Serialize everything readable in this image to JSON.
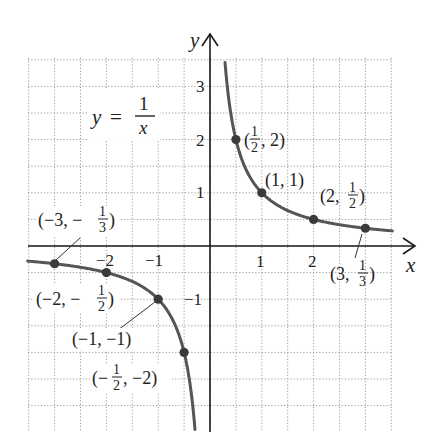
{
  "chart_data": {
    "type": "line",
    "title": "",
    "function": "y = 1/x",
    "equation_label": {
      "lhs": "y",
      "eq": "=",
      "num": "1",
      "den": "x"
    },
    "xlabel": "x",
    "ylabel": "y",
    "xlim": [
      -3.5,
      3.5
    ],
    "ylim": [
      -3.5,
      3.5
    ],
    "grid": true,
    "grid_step": 0.5,
    "x_ticks": [
      {
        "value": -2,
        "label": "−2"
      },
      {
        "value": -1,
        "label": "−1"
      },
      {
        "value": 1,
        "label": "1"
      },
      {
        "value": 2,
        "label": "2"
      }
    ],
    "y_ticks": [
      {
        "value": 3,
        "label": "3"
      },
      {
        "value": 2,
        "label": "2"
      },
      {
        "value": 1,
        "label": "1"
      },
      {
        "value": -1,
        "label": "−1"
      }
    ],
    "series": [
      {
        "name": "y = 1/x (x > 0)",
        "x_range": [
          0.29,
          3.5
        ]
      },
      {
        "name": "y = 1/x (x < 0)",
        "x_range": [
          -3.5,
          -0.29
        ]
      }
    ],
    "points": [
      {
        "x": 0.5,
        "y": 2,
        "label": "(1/2, 2)"
      },
      {
        "x": 1,
        "y": 1,
        "label": "(1, 1)"
      },
      {
        "x": 2,
        "y": 0.5,
        "label": "(2, 1/2)"
      },
      {
        "x": 3,
        "y": 0.3333,
        "label": "(3, 1/3)"
      },
      {
        "x": -3,
        "y": -0.3333,
        "label": "(−3, −1/3)"
      },
      {
        "x": -2,
        "y": -0.5,
        "label": "(−2, −1/2)"
      },
      {
        "x": -1,
        "y": -1,
        "label": "(−1, −1)"
      },
      {
        "x": -0.5,
        "y": -2,
        "label": "(−1/2, −2)"
      }
    ],
    "colors": {
      "curve": "#555555",
      "points": "#3a3a3a",
      "axes": "#1a1a1a",
      "grid": "#9a9a9a"
    }
  },
  "labels": {
    "p_half_2": {
      "open": "(",
      "num": "1",
      "den": "2",
      "rest": ", 2)"
    },
    "p_1_1": "(1, 1)",
    "p_2_half": {
      "open": "(2, ",
      "num": "1",
      "den": "2",
      "close": ")"
    },
    "p_3_third": {
      "open": "(3, ",
      "num": "1",
      "den": "3",
      "close": ")"
    },
    "p_m3_mthird": {
      "open": "(−3, −",
      "num": "1",
      "den": "3",
      "close": ")"
    },
    "p_m2_mhalf": {
      "open": "(−2, −",
      "num": "1",
      "den": "2",
      "close": ")"
    },
    "p_m1_m1": "(−1, −1)",
    "p_mhalf_m2": {
      "open": "(−",
      "num": "1",
      "den": "2",
      "rest": ", −2)"
    }
  }
}
